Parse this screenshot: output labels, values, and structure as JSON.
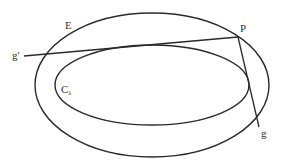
{
  "diagram": {
    "width": 283,
    "height": 166,
    "stroke_color": "#2a2a2a",
    "label_color": "#333333",
    "ellipses": [
      {
        "id": "E",
        "label": "E",
        "cx": 152,
        "cy": 85,
        "rx": 117,
        "ry": 72
      },
      {
        "id": "C_lambda",
        "label": "C",
        "label_sub": "λ",
        "cx": 152,
        "cy": 85,
        "rx": 97,
        "ry": 40
      }
    ],
    "points": [
      {
        "id": "P",
        "label": "P",
        "x": 238,
        "y": 37
      }
    ],
    "lines": [
      {
        "id": "g_prime",
        "label": "g'",
        "from": [
          24,
          56
        ],
        "to": [
          238,
          37
        ],
        "note": "tangent from P to C_lambda"
      },
      {
        "id": "g",
        "label": "g",
        "from": [
          238,
          37
        ],
        "to": [
          259,
          127
        ],
        "note": "tangent from P to C_lambda"
      }
    ],
    "labels": {
      "E": "E",
      "P": "P",
      "g_prime": "g'",
      "g": "g",
      "C": "C",
      "lambda": "λ"
    }
  }
}
